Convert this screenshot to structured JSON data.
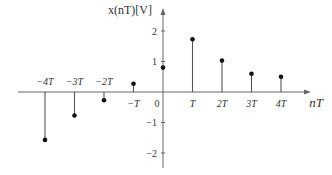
{
  "chart_data": {
    "type": "stem",
    "title": "",
    "xlabel": "nT",
    "ylabel": "x(nT)[V]",
    "categories": [
      "-4T",
      "-3T",
      "-2T",
      "-T",
      "0",
      "T",
      "2T",
      "3T",
      "4T"
    ],
    "x": [
      -4,
      -3,
      -2,
      -1,
      0,
      1,
      2,
      3,
      4
    ],
    "values": [
      -1.57,
      -0.77,
      -0.27,
      0.27,
      0.8,
      1.73,
      1.03,
      0.6,
      0.5
    ],
    "yticks": [
      2,
      1,
      -1,
      -2
    ],
    "ytick_labels": [
      "2",
      "1",
      "−1",
      "−2"
    ],
    "ylim": [
      -2.5,
      2.5
    ],
    "grid": false,
    "legend": null
  },
  "colors": {
    "axis": "#666666",
    "stem": "#555555",
    "marker": "#111111",
    "text": "#333333"
  },
  "layout": {
    "origin_x": 163,
    "origin_y": 92,
    "px_per_T": 29.5,
    "px_per_unit": 30.5,
    "axis_x_start": 18,
    "axis_x_end": 305,
    "axis_y_top": 14,
    "axis_y_bottom": 168
  }
}
